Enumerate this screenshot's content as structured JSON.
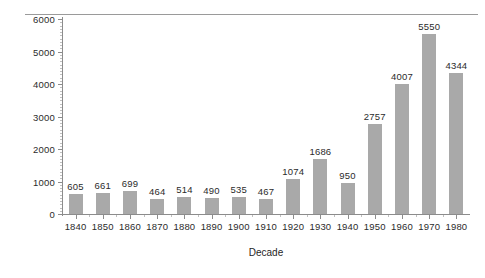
{
  "chart_data": {
    "type": "bar",
    "title": "",
    "xlabel": "Decade",
    "ylabel": "Number",
    "categories": [
      "1840",
      "1850",
      "1860",
      "1870",
      "1880",
      "1890",
      "1900",
      "1910",
      "1920",
      "1930",
      "1940",
      "1950",
      "1960",
      "1970",
      "1980"
    ],
    "values": [
      605,
      661,
      699,
      464,
      514,
      490,
      535,
      467,
      1074,
      1686,
      950,
      2757,
      4007,
      5550,
      4344
    ],
    "data_labels": [
      "605",
      "661",
      "699",
      "464",
      "514",
      "490",
      "535",
      "467",
      "1074",
      "1686",
      "950",
      "2757",
      "4007",
      "5550",
      "4344"
    ],
    "ylim": [
      0,
      6000
    ],
    "y_ticks": [
      0,
      1000,
      2000,
      3000,
      4000,
      5000,
      6000
    ],
    "y_tick_labels": [
      "0",
      "1000",
      "2000",
      "3000",
      "4000",
      "5000",
      "6000"
    ],
    "grid": false,
    "legend": null,
    "bar_color": "#a9a9a9",
    "axis_color": "#8c8c8c",
    "text_color": "#2b2b2b",
    "minor_ticks": true
  }
}
